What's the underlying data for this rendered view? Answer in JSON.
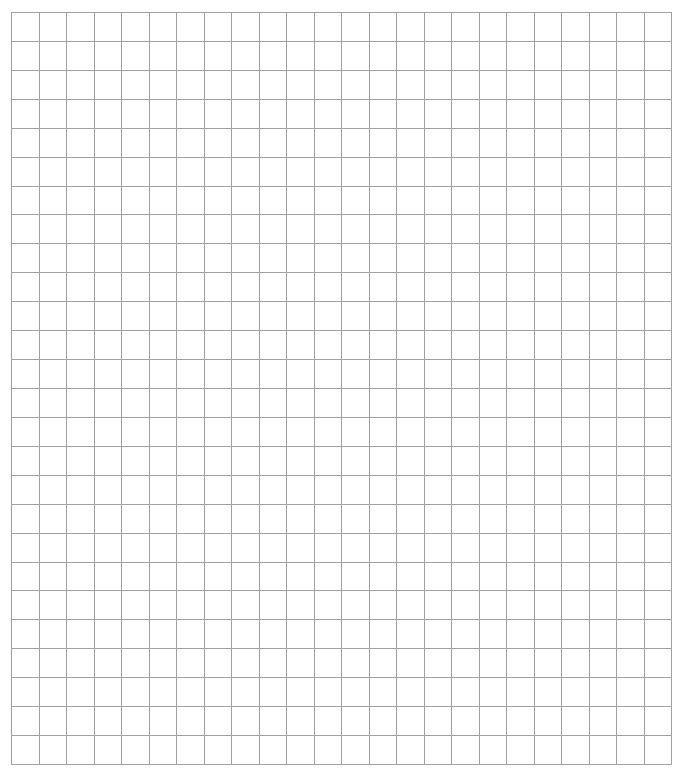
{
  "grid": {
    "columns": 24,
    "rows": 26,
    "left": 11,
    "top": 12,
    "width": 660,
    "height": 752,
    "line_color": "#a0a0a0",
    "background": "#ffffff"
  }
}
